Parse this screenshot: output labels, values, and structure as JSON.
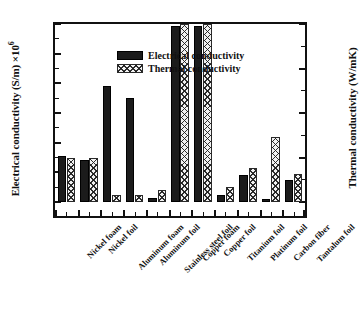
{
  "chart_data": {
    "type": "bar",
    "title": "",
    "xlabel": "",
    "ylabel": "Electrical conductivity (S/m) ×10⁶",
    "ylabel_secondary": "Thermal conductivity (W/mK)",
    "ylim": [
      0,
      60
    ],
    "ylim_secondary": [
      0,
      400
    ],
    "y_ticks": [
      0,
      10,
      20,
      30,
      40,
      50,
      60
    ],
    "y_ticks_secondary": [
      0,
      100,
      200,
      300,
      400
    ],
    "grid": false,
    "legend_position": "top-left",
    "categories": [
      "Nickel foam",
      "Nickel foil",
      "Aluminum foam",
      "Aluminum foil",
      "Stainless steel foil",
      "Copper foam",
      "Copper foil",
      "Titanium foil",
      "Platinum foil",
      "Carbon fiber",
      "Tantalum foil"
    ],
    "series": [
      {
        "name": "Electrical conductivity",
        "axis": "left",
        "unit": "S/m ×10⁶",
        "fill": "solid-black",
        "values": [
          15.6,
          14.3,
          39.1,
          34.9,
          1.3,
          59.4,
          59.4,
          2.2,
          9.1,
          -0.3,
          7.3
        ]
      },
      {
        "name": "Thermal conductivity",
        "axis": "right",
        "unit": "W/mK",
        "fill": "crosshatch",
        "values": [
          98,
          98,
          15,
          15,
          28,
          400,
          400,
          33,
          77,
          145,
          63
        ]
      }
    ]
  },
  "legend": {
    "items": [
      {
        "label": "Electrical conductivity",
        "swatch": "solid-black"
      },
      {
        "label": "Thermal conductivity",
        "swatch": "crosshatch"
      }
    ]
  },
  "axes": {
    "left": {
      "title_main": "Electrical conductivity (S/m) ×10",
      "title_exponent": "6",
      "tick_labels": [
        "60",
        "50",
        "40",
        "30",
        "20",
        "10",
        "0"
      ]
    },
    "right": {
      "title": "Thermal conductivity (W/mK)",
      "tick_labels": [
        "400",
        "300",
        "200",
        "100",
        "0"
      ]
    }
  },
  "colors": {
    "axis": "#111111",
    "bar_electrical": "#1b1b1b",
    "bar_thermal_fill": "#f2f2f2",
    "bar_thermal_hatch": "#1e1e1e",
    "background": "#ffffff"
  }
}
